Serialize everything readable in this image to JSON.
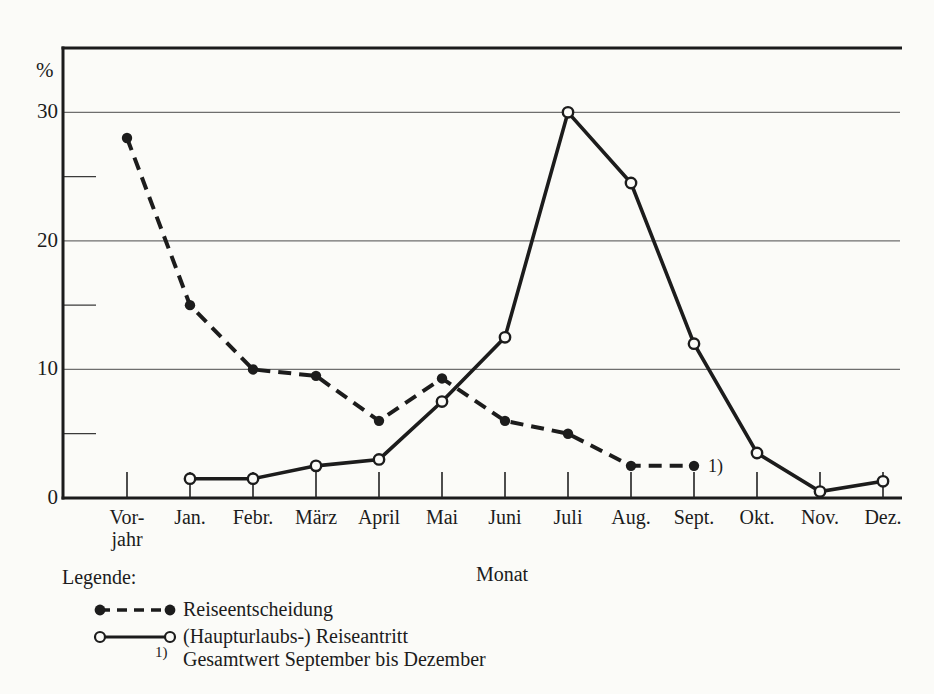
{
  "figure": {
    "background": "#fbfbf8",
    "ink": "#1c1c1c",
    "grid_color": "#6e6e6e"
  },
  "chart_data": {
    "type": "line",
    "title": "",
    "xlabel": "Monat",
    "ylabel": "%",
    "ylim": [
      0,
      35
    ],
    "grid": true,
    "grid_y": [
      10,
      20,
      30
    ],
    "y_major_ticks": [
      0,
      10,
      20,
      30
    ],
    "y_minor_ticks": [
      5,
      15,
      25
    ],
    "categories": [
      "Vor-\njahr",
      "Jan.",
      "Febr.",
      "März",
      "April",
      "Mai",
      "Juni",
      "Juli",
      "Aug.",
      "Sept.",
      "Okt.",
      "Nov.",
      "Dez."
    ],
    "series": [
      {
        "name": "Reiseentscheidung",
        "style": "dashed",
        "marker": "filled-circle",
        "values": [
          28,
          15,
          10,
          9.5,
          6,
          9.3,
          6,
          5,
          2.5,
          2.5,
          null,
          null,
          null
        ],
        "annotation": {
          "text": "1)",
          "at_category": "Sept."
        }
      },
      {
        "name": "(Haupturlaubs-) Reiseantritt",
        "style": "solid",
        "marker": "open-circle",
        "values": [
          null,
          1.5,
          1.5,
          2.5,
          3,
          7.5,
          12.5,
          30,
          24.5,
          12,
          3.5,
          0.5,
          1.3
        ]
      }
    ],
    "legend_position": "bottom-left"
  },
  "legend": {
    "title": "Legende:",
    "items": [
      {
        "label": "Reiseentscheidung"
      },
      {
        "label": "(Haupturlaubs-) Reiseantritt"
      }
    ],
    "footnote": {
      "marker": "1)",
      "text": "Gesamtwert September bis Dezember"
    }
  }
}
